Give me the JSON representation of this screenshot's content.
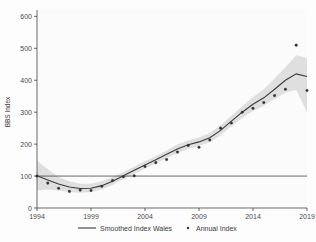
{
  "chart_data": {
    "type": "line",
    "title": "",
    "subtitle": "",
    "xlabel": "",
    "ylabel": "BBS Index",
    "xlim": [
      1994,
      2019
    ],
    "ylim": [
      0,
      620
    ],
    "grid": false,
    "legend_position": "bottom",
    "xticks": [
      "1994",
      "1999",
      "2004",
      "2009",
      "2014",
      "2019"
    ],
    "xtick_values": [
      1994,
      1999,
      2004,
      2009,
      2014,
      2019
    ],
    "yticks": [
      "0",
      "100",
      "200",
      "300",
      "400",
      "500",
      "600"
    ],
    "ytick_values": [
      0,
      100,
      200,
      300,
      400,
      500,
      600
    ],
    "reference_line": {
      "y": 100,
      "label": ""
    },
    "x": [
      1994,
      1995,
      1996,
      1997,
      1998,
      1999,
      2000,
      2001,
      2002,
      2003,
      2004,
      2005,
      2006,
      2007,
      2008,
      2009,
      2010,
      2011,
      2012,
      2013,
      2014,
      2015,
      2016,
      2017,
      2018,
      2019
    ],
    "series": [
      {
        "name": "Annual Index",
        "type": "scatter",
        "color": "#333333",
        "values": [
          100,
          78,
          62,
          52,
          56,
          55,
          68,
          86,
          98,
          101,
          130,
          142,
          152,
          175,
          196,
          190,
          213,
          250,
          266,
          300,
          312,
          330,
          352,
          372,
          510,
          368
        ]
      },
      {
        "name": "Smoothed Index Wales",
        "type": "line",
        "color": "#3a3a3a",
        "values": [
          101,
          88,
          75,
          66,
          61,
          62,
          70,
          84,
          101,
          118,
          135,
          151,
          168,
          185,
          198,
          207,
          220,
          243,
          272,
          300,
          325,
          345,
          372,
          400,
          420,
          412
        ],
        "ci_lower": [
          55,
          58,
          55,
          50,
          48,
          50,
          58,
          72,
          90,
          107,
          124,
          140,
          156,
          172,
          185,
          194,
          206,
          228,
          256,
          282,
          304,
          320,
          341,
          362,
          370,
          300
        ],
        "ci_upper": [
          148,
          121,
          97,
          84,
          76,
          76,
          84,
          97,
          113,
          130,
          147,
          163,
          181,
          199,
          212,
          221,
          235,
          259,
          289,
          319,
          347,
          372,
          405,
          441,
          478,
          470
        ]
      }
    ],
    "legend": [
      {
        "label": "Smoothed Index Wales",
        "marker": "line",
        "color": "#3a3a3a"
      },
      {
        "label": "Annual Index",
        "marker": "dot",
        "color": "#333333"
      }
    ]
  },
  "axis": {
    "y_title": "BBS Index"
  },
  "legend": {
    "smoothed_label": "Smoothed Index Wales",
    "annual_label": "Annual Index"
  }
}
